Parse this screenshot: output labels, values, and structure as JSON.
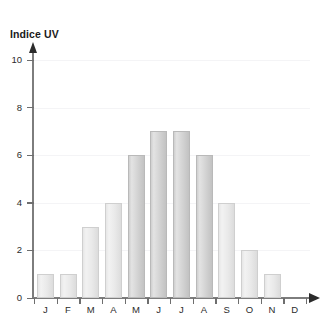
{
  "top_strip": {
    "text": ""
  },
  "chart_data": {
    "type": "bar",
    "title": "",
    "ylabel": "Indice UV",
    "xlabel": "",
    "categories": [
      "J",
      "F",
      "M",
      "A",
      "M",
      "J",
      "J",
      "A",
      "S",
      "O",
      "N",
      "D"
    ],
    "values": [
      1,
      1,
      3,
      4,
      6,
      7,
      7,
      6,
      4,
      2,
      1,
      0
    ],
    "ylim": [
      0,
      10
    ],
    "ytick_labels": [
      "0",
      "2",
      "4",
      "6",
      "8",
      "10"
    ],
    "ytick_values": [
      0,
      2,
      4,
      6,
      8,
      10
    ],
    "grid": true,
    "legend": null,
    "bar_color": "#d4d4d4",
    "bar_color_light": "#e9e9e9",
    "bar_border": "#b9b9b9",
    "axis_color": "#7d7d7d",
    "text_color": "#2b2b2b"
  }
}
